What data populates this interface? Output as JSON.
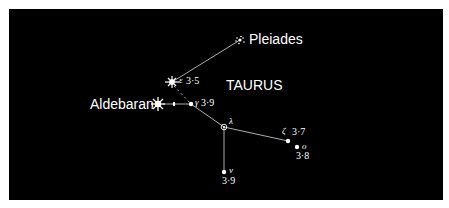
{
  "diagram": {
    "title": "TAURUS",
    "background_color": "#000000",
    "foreground_color": "#ffffff",
    "labels": {
      "pleiades": "Pleiades",
      "aldebaran": "Aldebaran",
      "epsilon_greek": "ε",
      "epsilon_mag": "3·5",
      "gamma_greek": "γ",
      "gamma_mag": "3·9",
      "lambda_greek": "λ",
      "zeta_greek": "ζ",
      "zeta_mag": "3·7",
      "omicron_greek": "o",
      "omicron_mag": "3·8",
      "nu_greek": "ν",
      "nu_mag": "3·9"
    },
    "stars": [
      {
        "name": "Pleiades",
        "symbol": "cluster",
        "x": 240,
        "y": 40
      },
      {
        "name": "epsilon",
        "symbol": "bright-star",
        "magnitude": "3·5",
        "x": 172,
        "y": 82
      },
      {
        "name": "Aldebaran",
        "symbol": "star-burst",
        "x": 158,
        "y": 104
      },
      {
        "name": "theta",
        "symbol": "double-dot",
        "x": 174,
        "y": 104
      },
      {
        "name": "gamma",
        "magnitude": "3·9",
        "x": 191,
        "y": 104
      },
      {
        "name": "lambda",
        "symbol": "variable",
        "x": 224,
        "y": 127
      },
      {
        "name": "zeta",
        "magnitude": "3·7",
        "x": 288,
        "y": 141
      },
      {
        "name": "omicron",
        "magnitude": "3·8",
        "x": 297,
        "y": 147
      },
      {
        "name": "nu",
        "magnitude": "3·9",
        "x": 224,
        "y": 172
      }
    ]
  }
}
